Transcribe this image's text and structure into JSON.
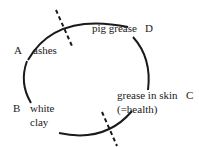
{
  "diagram": {
    "type": "cycle",
    "nodes": [
      {
        "id": "A",
        "letter": "A",
        "label": "ashes"
      },
      {
        "id": "B",
        "letter": "B",
        "label_line1": "white",
        "label_line2": "clay"
      },
      {
        "id": "C",
        "letter": "C",
        "label_line1": "grease in skin",
        "label_line2": "(=health)"
      },
      {
        "id": "D",
        "letter": "D",
        "label": "pig grease"
      }
    ],
    "dividers": 2,
    "stroke_color": "#1a1a1a"
  }
}
